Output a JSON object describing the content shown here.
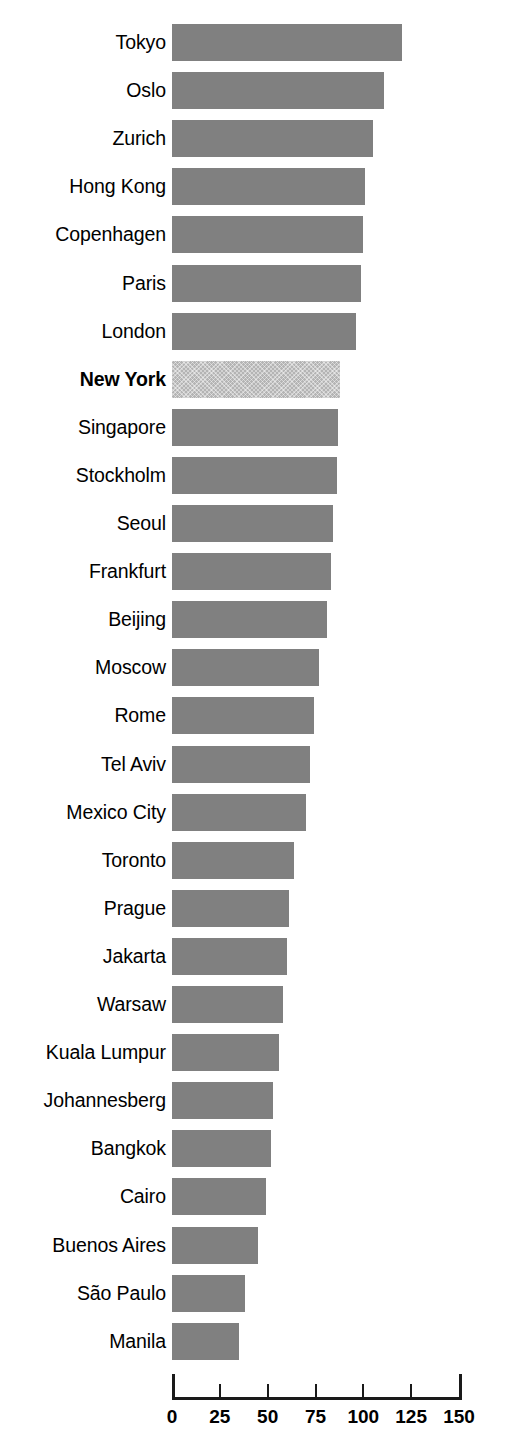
{
  "chart_data": {
    "type": "bar",
    "orientation": "horizontal",
    "title": "",
    "subtitle": "",
    "xlabel": "",
    "ylabel": "",
    "xlim": [
      0,
      150
    ],
    "ylim": null,
    "grid": false,
    "legend": null,
    "xticks": [
      0,
      25,
      50,
      75,
      100,
      125,
      150
    ],
    "xtick_labels": [
      "0",
      "25",
      "50",
      "75",
      "100",
      "125",
      "150"
    ],
    "categories": [
      "Tokyo",
      "Oslo",
      "Zurich",
      "Hong Kong",
      "Copenhagen",
      "Paris",
      "London",
      "New York",
      "Singapore",
      "Stockholm",
      "Seoul",
      "Frankfurt",
      "Beijing",
      "Moscow",
      "Rome",
      "Tel Aviv",
      "Mexico City",
      "Toronto",
      "Prague",
      "Jakarta",
      "Warsaw",
      "Kuala Lumpur",
      "Johannesberg",
      "Bangkok",
      "Cairo",
      "Buenos Aires",
      "São Paulo",
      "Manila"
    ],
    "values": [
      120,
      111,
      105,
      101,
      100,
      99,
      96,
      88,
      87,
      86,
      84,
      83,
      81,
      77,
      74,
      72,
      70,
      64,
      61,
      60,
      58,
      56,
      53,
      52,
      49,
      45,
      38,
      35
    ],
    "highlight_index": 7,
    "highlight_category": "New York"
  },
  "colors": {
    "bar": "#808080",
    "bar_highlight": "#b4b4b4",
    "axis": "#1a1a1a",
    "text": "#000000",
    "background": "#ffffff"
  }
}
